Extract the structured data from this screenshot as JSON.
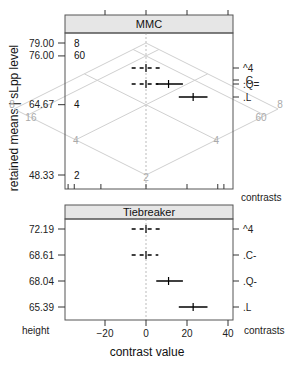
{
  "chart_data": [
    {
      "type": "scatter",
      "panel": "MMC",
      "title": "MMC",
      "xlabel": "contrast value",
      "ylabel": "retained means  |  sLpp level",
      "xlim": [
        -40,
        42
      ],
      "ylim": [
        44,
        82
      ],
      "x_ticks": [
        -20,
        0,
        20,
        40
      ],
      "y_ticks": [
        {
          "value": 79.0,
          "label": "79.00",
          "level": "8"
        },
        {
          "value": 76.0,
          "label": "76.00",
          "level": "60"
        },
        {
          "value": 64.67,
          "label": "64.67",
          "level": "4"
        },
        {
          "value": 48.33,
          "label": "48.33",
          "level": "2"
        }
      ],
      "isomeans_grid": {
        "levels": [
          {
            "name": "2",
            "mean": 48.33
          },
          {
            "name": "4",
            "mean": 64.67
          },
          {
            "name": "60",
            "mean": 76.0
          },
          {
            "name": "8",
            "mean": 79.0
          }
        ],
        "extra_labels": [
          "16"
        ]
      },
      "contrasts_label": "contrasts",
      "contrasts": [
        {
          "name": "^4",
          "height": 74.0,
          "estimate": 0,
          "lower": -7,
          "upper": 7,
          "significant": false
        },
        {
          "name": ".C",
          "height": 70.3,
          "estimate": 0,
          "lower": -7,
          "upper": 6,
          "significant": false
        },
        {
          "name": ".Q",
          "height": 70.0,
          "estimate": 11,
          "lower": 5,
          "upper": 18,
          "significant": true
        },
        {
          "name": ".L",
          "height": 65.3,
          "estimate": 23,
          "lower": 16,
          "upper": 30,
          "significant": true
        }
      ],
      "right_labels": [
        "^4",
        ".C",
        ".Q",
        ".L"
      ]
    },
    {
      "type": "scatter",
      "panel": "Tiebreaker",
      "title": "Tiebreaker",
      "xlabel": "contrast value",
      "ylabel": "height",
      "xlim": [
        -40,
        42
      ],
      "x_ticks": [
        -20,
        0,
        20,
        40
      ],
      "y_ticks": [
        {
          "label": "72.19"
        },
        {
          "label": "68.61"
        },
        {
          "label": "68.04"
        },
        {
          "label": "65.39"
        }
      ],
      "contrasts_label": "contrasts",
      "contrasts": [
        {
          "name": "^4",
          "height": 72.19,
          "estimate": 0,
          "lower": -7,
          "upper": 7,
          "significant": false
        },
        {
          "name": ".C-",
          "height": 68.61,
          "estimate": 0,
          "lower": -7,
          "upper": 6,
          "significant": false
        },
        {
          "name": ".Q-",
          "height": 68.04,
          "estimate": 11,
          "lower": 5,
          "upper": 18,
          "significant": true
        },
        {
          "name": ".L",
          "height": 65.39,
          "estimate": 23,
          "lower": 16,
          "upper": 30,
          "significant": true
        }
      ]
    }
  ],
  "labels": {
    "ylabel_main": "retained means  |  sLpp level",
    "xlabel": "contrast value",
    "height_label": "height",
    "contrasts_label_top": "contrasts",
    "contrasts_label_bottom": "contrasts",
    "mmc_title": "MMC",
    "tiebreaker_title": "Tiebreaker"
  },
  "colors": {
    "significant": "#000000",
    "nonsignificant": "#000000",
    "grid": "#d0d0d0",
    "strip_bg": "#e6e6e6",
    "zero_line": "#bbbbbb"
  }
}
